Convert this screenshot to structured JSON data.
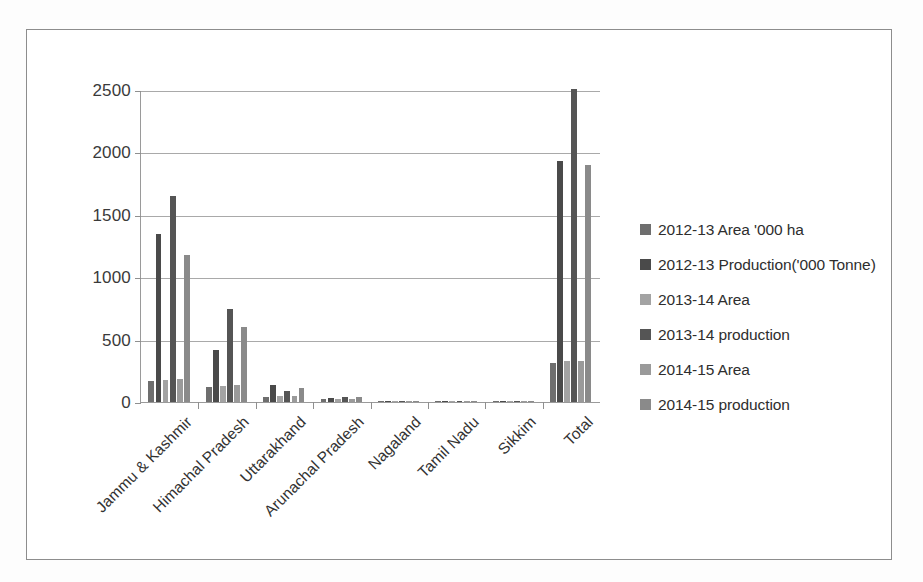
{
  "chart_data": {
    "type": "bar",
    "title": "",
    "xlabel": "",
    "ylabel": "",
    "ylim": [
      0,
      2500
    ],
    "yticks": [
      0,
      500,
      1000,
      1500,
      2000,
      2500
    ],
    "grid": true,
    "legend_position": "right",
    "categories": [
      "Jammu & Kashmir",
      "Himachal Pradesh",
      "Uttarakhand",
      "Arunachal Pradesh",
      "Nagaland",
      "Tamil Nadu",
      "Sikkim",
      "Total"
    ],
    "series": [
      {
        "name": "2012-13 Area '000 ha",
        "color": "#6e6e6e",
        "values": [
          167,
          118,
          43,
          22,
          6,
          3,
          2,
          310
        ]
      },
      {
        "name": "2012-13 Production('000 Tonne)",
        "color": "#4a4a4a",
        "values": [
          1348,
          420,
          133,
          35,
          9,
          4,
          2,
          1928
        ]
      },
      {
        "name": "2013-14 Area",
        "color": "#a3a3a3",
        "values": [
          178,
          126,
          46,
          24,
          7,
          3,
          2,
          325
        ]
      },
      {
        "name": "2013-14 production",
        "color": "#555555",
        "values": [
          1648,
          742,
          92,
          38,
          10,
          4,
          2,
          2512
        ]
      },
      {
        "name": "2014-15 Area",
        "color": "#9a9a9a",
        "values": [
          186,
          135,
          48,
          26,
          7,
          3,
          2,
          331
        ]
      },
      {
        "name": "2014-15 production",
        "color": "#8a8a8a",
        "values": [
          1182,
          603,
          112,
          44,
          9,
          4,
          2,
          1898
        ]
      }
    ]
  },
  "axis": {
    "tick_labels": [
      "2500",
      "2000",
      "1500",
      "1000",
      "500",
      "0"
    ]
  }
}
